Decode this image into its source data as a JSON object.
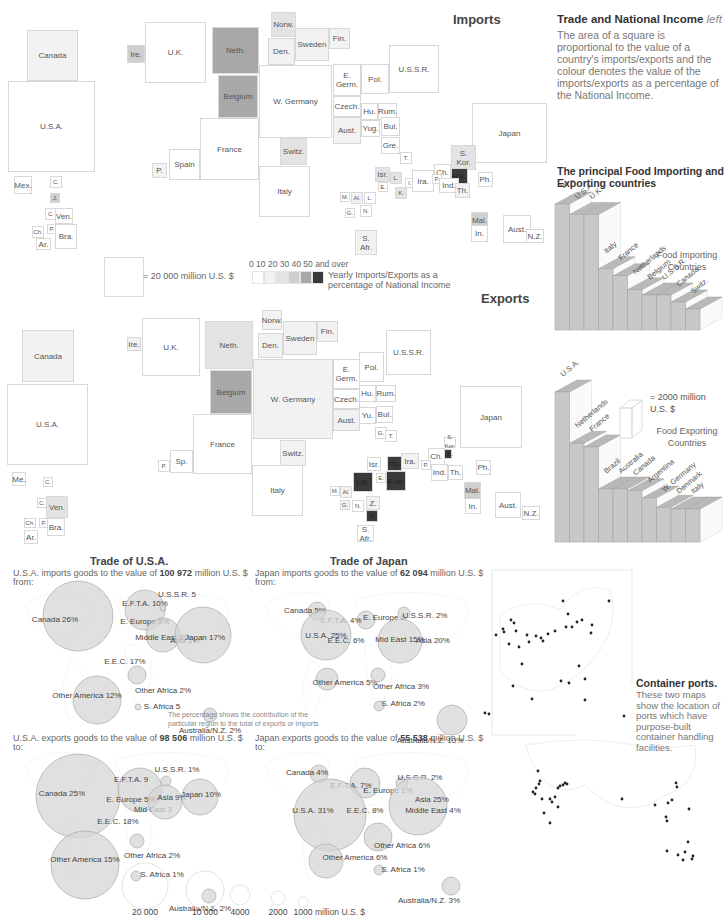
{
  "imports": {
    "title": "Imports",
    "squares": [
      {
        "label": "Canada",
        "shade": 1
      },
      {
        "label": "U.S.A.",
        "shade": 0
      },
      {
        "label": "Mex.",
        "shade": 0
      },
      {
        "label": "C.",
        "shade": 0
      },
      {
        "label": "J.",
        "shade": 3
      },
      {
        "label": "C.",
        "shade": 0
      },
      {
        "label": "Ven.",
        "shade": 0
      },
      {
        "label": "P.",
        "shade": 0
      },
      {
        "label": "Ch.",
        "shade": 0
      },
      {
        "label": "Bra.",
        "shade": 0
      },
      {
        "label": "Ar.",
        "shade": 0
      },
      {
        "label": "Ire.",
        "shade": 3
      },
      {
        "label": "U.K.",
        "shade": 0
      },
      {
        "label": "Neth.",
        "shade": 4
      },
      {
        "label": "Belgium",
        "shade": 4
      },
      {
        "label": "Norw.",
        "shade": 2
      },
      {
        "label": "Den.",
        "shade": 1
      },
      {
        "label": "Sweden",
        "shade": 1
      },
      {
        "label": "Fin.",
        "shade": 1
      },
      {
        "label": "W. Germany",
        "shade": 0
      },
      {
        "label": "France",
        "shade": 0
      },
      {
        "label": "Spain",
        "shade": 0
      },
      {
        "label": "P.",
        "shade": 1
      },
      {
        "label": "Switz.",
        "shade": 2
      },
      {
        "label": "Italy",
        "shade": 0
      },
      {
        "label": "E. Germ.",
        "shade": 0
      },
      {
        "label": "Czech.",
        "shade": 0
      },
      {
        "label": "Aust.",
        "shade": 1
      },
      {
        "label": "Pol.",
        "shade": 0
      },
      {
        "label": "U.S.S.R.",
        "shade": 0
      },
      {
        "label": "Hu.",
        "shade": 0
      },
      {
        "label": "Rum.",
        "shade": 0
      },
      {
        "label": "Yug.",
        "shade": 0
      },
      {
        "label": "Bul.",
        "shade": 0
      },
      {
        "label": "Gre.",
        "shade": 0
      },
      {
        "label": "T.",
        "shade": 0
      },
      {
        "label": "Japan",
        "shade": 0
      },
      {
        "label": "S. Kor.",
        "shade": 2
      },
      {
        "label": "H.K.",
        "shade": 5
      },
      {
        "label": "Ch.",
        "shade": 0
      },
      {
        "label": "Ph.",
        "shade": 0
      },
      {
        "label": "Isr.",
        "shade": 2
      },
      {
        "label": "L.",
        "shade": 2
      },
      {
        "label": "I.",
        "shade": 0
      },
      {
        "label": "Ira.",
        "shade": 0
      },
      {
        "label": "P.",
        "shade": 0
      },
      {
        "label": "Ind.",
        "shade": 0
      },
      {
        "label": "Th.",
        "shade": 1
      },
      {
        "label": "E.",
        "shade": 0
      },
      {
        "label": "K.",
        "shade": 2
      },
      {
        "label": "M.",
        "shade": 0
      },
      {
        "label": "Al.",
        "shade": 1
      },
      {
        "label": "L.",
        "shade": 0
      },
      {
        "label": "G.",
        "shade": 0
      },
      {
        "label": "N.",
        "shade": 0
      },
      {
        "label": "S. Afr.",
        "shade": 1
      },
      {
        "label": "Mal.",
        "shade": 3
      },
      {
        "label": "In.",
        "shade": 0
      },
      {
        "label": "Aust.",
        "shade": 0
      },
      {
        "label": "N.Z.",
        "shade": 0
      }
    ]
  },
  "exports": {
    "title": "Exports",
    "squares": [
      {
        "label": "Canada",
        "shade": 1
      },
      {
        "label": "U.S.A.",
        "shade": 0
      },
      {
        "label": "Me.",
        "shade": 0
      },
      {
        "label": "C.",
        "shade": 0
      },
      {
        "label": "C.",
        "shade": 0
      },
      {
        "label": "Ven.",
        "shade": 2
      },
      {
        "label": "Ch.",
        "shade": 0
      },
      {
        "label": "P.",
        "shade": 0
      },
      {
        "label": "Bra.",
        "shade": 0
      },
      {
        "label": "Ar.",
        "shade": 0
      },
      {
        "label": "Ire.",
        "shade": 1
      },
      {
        "label": "U.K.",
        "shade": 0
      },
      {
        "label": "Neth.",
        "shade": 2
      },
      {
        "label": "Belgium",
        "shade": 4
      },
      {
        "label": "Norw.",
        "shade": 1
      },
      {
        "label": "Den.",
        "shade": 1
      },
      {
        "label": "Sweden",
        "shade": 1
      },
      {
        "label": "Fin.",
        "shade": 1
      },
      {
        "label": "W. Germany",
        "shade": 1
      },
      {
        "label": "France",
        "shade": 0
      },
      {
        "label": "Sp.",
        "shade": 0
      },
      {
        "label": "P.",
        "shade": 0
      },
      {
        "label": "Switz.",
        "shade": 1
      },
      {
        "label": "Italy",
        "shade": 0
      },
      {
        "label": "E. Germ.",
        "shade": 0
      },
      {
        "label": "Czech.",
        "shade": 0
      },
      {
        "label": "Aust.",
        "shade": 1
      },
      {
        "label": "Pol.",
        "shade": 0
      },
      {
        "label": "U.S.S.R.",
        "shade": 0
      },
      {
        "label": "Hu.",
        "shade": 0
      },
      {
        "label": "Rum.",
        "shade": 0
      },
      {
        "label": "Yu.",
        "shade": 0
      },
      {
        "label": "Bul.",
        "shade": 0
      },
      {
        "label": "G.",
        "shade": 0
      },
      {
        "label": "T.",
        "shade": 0
      },
      {
        "label": "Japan",
        "shade": 0
      },
      {
        "label": "S. Kor.",
        "shade": 0
      },
      {
        "label": "H.K.",
        "shade": 5
      },
      {
        "label": "Ch.",
        "shade": 0
      },
      {
        "label": "Ph.",
        "shade": 0
      },
      {
        "label": "Isr.",
        "shade": 0
      },
      {
        "label": "Irq.",
        "shade": 5
      },
      {
        "label": "Ira.",
        "shade": 1
      },
      {
        "label": "Kuw.",
        "shade": 5
      },
      {
        "label": "P.",
        "shade": 0
      },
      {
        "label": "Ind.",
        "shade": 0
      },
      {
        "label": "Th.",
        "shade": 0
      },
      {
        "label": "Lib.",
        "shade": 5
      },
      {
        "label": "E.",
        "shade": 0
      },
      {
        "label": "M.",
        "shade": 0
      },
      {
        "label": "Al.",
        "shade": 1
      },
      {
        "label": "G.",
        "shade": 1
      },
      {
        "label": "N.",
        "shade": 0
      },
      {
        "label": "Z.",
        "shade": 1
      },
      {
        "label": "Z.",
        "shade": 5
      },
      {
        "label": "S. Afr.",
        "shade": 0
      },
      {
        "label": "Mal.",
        "shade": 3
      },
      {
        "label": "In.",
        "shade": 0
      },
      {
        "label": "Aust.",
        "shade": 0
      },
      {
        "label": "N.Z.",
        "shade": 0
      }
    ]
  },
  "legend": {
    "scale_label": "= 20 000 million U.S. $",
    "shade_ticks": "0  10  20  30 40 50 and over",
    "shade_caption_1": "Yearly Imports/Exports as a",
    "shade_caption_2": "percentage of National Income",
    "shade_colors": [
      "#ffffff",
      "#f2f2f2",
      "#e3e3e3",
      "#cfcfcf",
      "#a8a8a8",
      "#3a3a3a"
    ]
  },
  "description": {
    "title": "Trade and National Income",
    "title_suffix": "left",
    "body": "The area of a square is proportional to the value of a country's imports/exports and the colour denotes the value of the imports/exports as a percentage of the National Income."
  },
  "chart_data": [
    {
      "type": "bar",
      "title": "The principal Food Importing and Exporting countries",
      "subtitle": "Food Importing Countries",
      "categories": [
        "W. Germ.",
        "U.S.A.",
        "U.K.",
        "Italy",
        "France",
        "Netherlands",
        "Belgium",
        "U.S.S.R.",
        "Canada",
        "Switz."
      ],
      "values": [
        7.2,
        6.6,
        6.6,
        3.5,
        3.1,
        2.3,
        2.0,
        2.0,
        1.6,
        1.2
      ],
      "ylabel": "million U.S. $",
      "scale_note": "= 2000 million U.S. $"
    },
    {
      "type": "bar",
      "title": "The principal Food Importing and Exporting countries",
      "subtitle": "Food Exporting Countries",
      "categories": [
        "U.S.A.",
        "Netherlands",
        "France",
        "Brazil",
        "Australia",
        "Canada",
        "Argentina",
        "W. Germany",
        "Denmark",
        "Italy"
      ],
      "values": [
        8.2,
        5.4,
        5.2,
        2.9,
        2.9,
        2.8,
        2.4,
        1.9,
        1.8,
        1.8
      ],
      "ylabel": "million U.S. $",
      "scale_note": "= 2000 million U.S. $"
    }
  ],
  "food_chart": {
    "title_line1": "The principal Food Importing and",
    "title_line2": "Exporting countries",
    "import_label_1": "Food Importing",
    "import_label_2": "Countries",
    "export_label_1": "Food Exporting",
    "export_label_2": "Countries",
    "unit_1": "= 2000 million",
    "unit_2": "U.S. $"
  },
  "trade_usa": {
    "title": "Trade of U.S.A.",
    "imports_text": "U.S.A. imports goods to the value of",
    "imports_value": "100 972",
    "imports_unit": "million U.S. $",
    "imports_from": "from:",
    "exports_text": "U.S.A. exports goods to the value of",
    "exports_value": "98 506",
    "exports_unit": "million U.S. $",
    "exports_to": "to:",
    "imports_bubbles": [
      {
        "label": "Canada 26%",
        "pct": 26
      },
      {
        "label": "E.F.T.A. 10%",
        "pct": 10
      },
      {
        "label": "E. Europe 5%",
        "pct": 5
      },
      {
        "label": "U.S.S.R. 5",
        "pct": 0.5
      },
      {
        "label": "Middle East 9%",
        "pct": 9
      },
      {
        "label": "Asia 1%",
        "pct": 1
      },
      {
        "label": "Japan 17%",
        "pct": 17
      },
      {
        "label": "E.E.C. 17%",
        "pct": 17
      },
      {
        "label": "Other America 12%",
        "pct": 12
      },
      {
        "label": "Other Africa 2%",
        "pct": 2
      },
      {
        "label": "S. Africa 5",
        "pct": 0.5
      },
      {
        "label": "Australia/N.Z. 2%",
        "pct": 2
      }
    ],
    "exports_bubbles": [
      {
        "label": "Canada 25%",
        "pct": 25
      },
      {
        "label": "E.F.T.A. 9",
        "pct": 9
      },
      {
        "label": "E. Europe 5%",
        "pct": 5
      },
      {
        "label": "U.S.S.R. 1%",
        "pct": 1
      },
      {
        "label": "Mid East 3",
        "pct": 3
      },
      {
        "label": "Asia 9%",
        "pct": 9
      },
      {
        "label": "Japan 10%",
        "pct": 10
      },
      {
        "label": "E.E.C. 18%",
        "pct": 18
      },
      {
        "label": "Other America 15%",
        "pct": 15
      },
      {
        "label": "Other Africa 2%",
        "pct": 2
      },
      {
        "label": "S. Africa 1%",
        "pct": 1
      },
      {
        "label": "Australia/N.Z. 2%",
        "pct": 2
      }
    ],
    "note_1": "The percentage shows the contribution of the",
    "note_2": "particular region to the total of exports or imports"
  },
  "trade_japan": {
    "title": "Trade of Japan",
    "imports_text": "Japan imports goods to the value of",
    "imports_value": "62 094",
    "imports_unit": "million U.S. $",
    "imports_from": "from:",
    "exports_text": "Japan exports goods to the value of",
    "exports_value": "55 538",
    "exports_unit": "million U.S. $",
    "exports_to": "to:",
    "imports_bubbles": [
      {
        "label": "Canada 5%",
        "pct": 5
      },
      {
        "label": "E.F.T.A. 4%",
        "pct": 4
      },
      {
        "label": "E. Europe 5",
        "pct": 0.5
      },
      {
        "label": "U.S.S.R. 2%",
        "pct": 2
      },
      {
        "label": "U.S.A. 25%",
        "pct": 25
      },
      {
        "label": "E.E.C. 6%",
        "pct": 6
      },
      {
        "label": "Mid East 15%",
        "pct": 15
      },
      {
        "label": "Asia 20%",
        "pct": 20
      },
      {
        "label": "Other America 5%",
        "pct": 5
      },
      {
        "label": "Other Africa 3%",
        "pct": 3
      },
      {
        "label": "S. Africa 2%",
        "pct": 2
      },
      {
        "label": "Australia/N.Z. 10%",
        "pct": 10
      }
    ],
    "exports_bubbles": [
      {
        "label": "Canada 4%",
        "pct": 4
      },
      {
        "label": "E.F.T.A. 7%",
        "pct": 7
      },
      {
        "label": "E. Europe 1%",
        "pct": 1
      },
      {
        "label": "U.S.S.R. 2%",
        "pct": 2
      },
      {
        "label": "U.S.A. 31%",
        "pct": 31
      },
      {
        "label": "E.E.C. 8%",
        "pct": 8
      },
      {
        "label": "Asia 25%",
        "pct": 25
      },
      {
        "label": "Middle East 4%",
        "pct": 4
      },
      {
        "label": "Other America 6%",
        "pct": 6
      },
      {
        "label": "Other Africa 6%",
        "pct": 6
      },
      {
        "label": "S. Africa 1%",
        "pct": 1
      },
      {
        "label": "Australia/N.Z. 3%",
        "pct": 3
      }
    ]
  },
  "bubble_scale": {
    "values": [
      "20 000",
      "10 000",
      "4000",
      "2000",
      "1000"
    ],
    "unit": "million U.S. $"
  },
  "container_ports": {
    "title": "Container ports.",
    "body": "These two maps show the location of ports which have purpose-built container handling facilities."
  }
}
